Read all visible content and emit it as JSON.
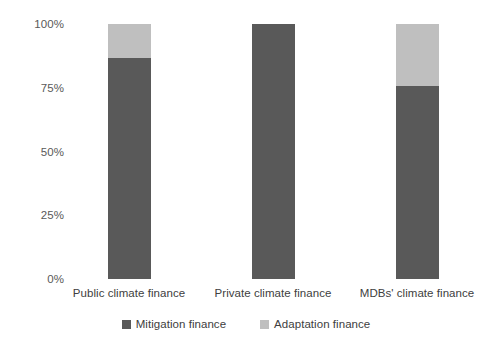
{
  "chart_data": {
    "type": "bar",
    "subtype": "stacked-100-percent",
    "title": "",
    "subtitle": "",
    "xlabel": "",
    "ylabel": "",
    "categories": [
      "Public climate finance",
      "Private climate finance",
      "MDBs' climate finance"
    ],
    "series": [
      {
        "name": "Mitigation finance",
        "color": "#595959",
        "values": [
          86.7,
          100.0,
          75.5
        ]
      },
      {
        "name": "Adaptation finance",
        "color": "#bfbfbf",
        "values": [
          13.3,
          0.0,
          24.5
        ]
      }
    ],
    "ylim": [
      0,
      100
    ],
    "y_ticks": [
      0,
      25,
      50,
      75,
      100
    ],
    "y_tick_labels": [
      "0%",
      "25%",
      "50%",
      "75%",
      "100%"
    ],
    "grid": false,
    "axis_lines": false,
    "legend_position": "bottom"
  },
  "axis": {
    "y_tick_labels": [
      "100%",
      "75%",
      "50%",
      "25%",
      "0%"
    ]
  },
  "categories": {
    "c0": "Public climate finance",
    "c1": "Private climate finance",
    "c2": "MDBs' climate finance"
  },
  "legend": {
    "items": [
      {
        "label": "Mitigation finance",
        "color": "#595959"
      },
      {
        "label": "Adaptation finance",
        "color": "#bfbfbf"
      }
    ]
  }
}
